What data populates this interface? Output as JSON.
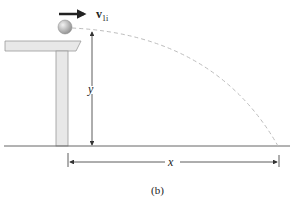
{
  "figure": {
    "caption": "(b)",
    "velocity_label": "v",
    "velocity_subscript": "1i",
    "height_label": "y",
    "range_label": "x"
  },
  "colors": {
    "table": "#e6e6e6",
    "table_edge": "#9a9a9a",
    "ball": "#b0b0b0",
    "trajectory": "#bdbdbd",
    "arrows": "#333333",
    "ground": "#666666"
  }
}
